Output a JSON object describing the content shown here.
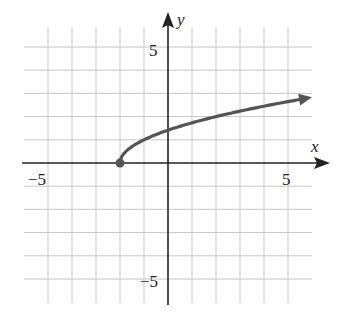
{
  "chart_data": {
    "type": "line",
    "title": "",
    "xlabel": "x",
    "ylabel": "y",
    "xlim": [
      -6,
      6
    ],
    "ylim": [
      -6,
      6
    ],
    "grid": true,
    "x_ticks_labeled": [
      -5,
      5
    ],
    "y_ticks_labeled": [
      5,
      -5
    ],
    "tick_labels": {
      "x_neg": "−5",
      "x_pos": "5",
      "y_pos": "5",
      "y_neg": "−5"
    },
    "series": [
      {
        "name": "y = √(x + 2)",
        "start_point": {
          "x": -2,
          "y": 0,
          "marker": "filled-circle"
        },
        "end": "arrow",
        "x": [
          -2,
          -1.5,
          -1,
          0,
          1,
          2,
          3,
          4,
          5,
          6
        ],
        "y": [
          0,
          0.71,
          1,
          1.41,
          1.73,
          2,
          2.24,
          2.45,
          2.65,
          2.83
        ]
      }
    ],
    "colors": {
      "curve": "#555555",
      "axes": "#222222",
      "grid": "#c8c8c8"
    }
  }
}
